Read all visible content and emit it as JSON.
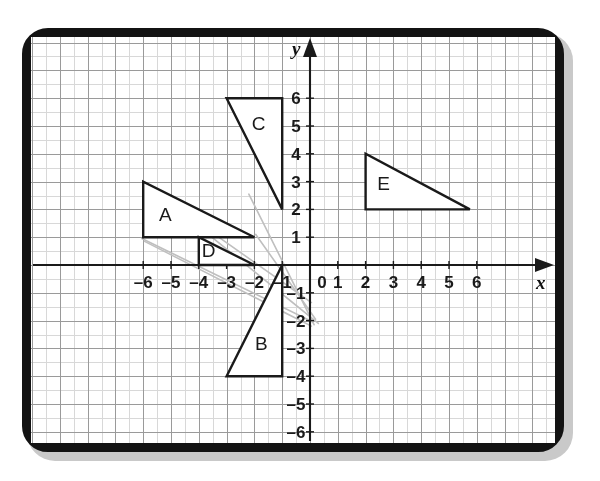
{
  "figure": {
    "kind": "coordinate-plane-with-triangles",
    "background_color": "#ffffff",
    "frame_color": "#131313",
    "grid_minor_color": "#d8d8d8",
    "grid_major_color": "#9a9a9a",
    "axis_color": "#1a1a1a",
    "shape_stroke_color": "#1a1a1a",
    "shape_fill_color": "#ffffff",
    "ghost_line_color": "#bfbfbf"
  },
  "axes": {
    "x_label": "x",
    "y_label": "y",
    "origin_label": "0",
    "x_range": [
      -6.9,
      7.4
    ],
    "y_range": [
      -7.1,
      6.9
    ],
    "unit_px": 27.8,
    "x_tick_labels": [
      "–6",
      "–5",
      "–4",
      "–3",
      "–2",
      "–1",
      "1",
      "2",
      "3",
      "4",
      "5",
      "6"
    ],
    "x_tick_values": [
      -6,
      -5,
      -4,
      -3,
      -2,
      -1,
      1,
      2,
      3,
      4,
      5,
      6
    ],
    "y_tick_labels": [
      "6",
      "5",
      "4",
      "3",
      "2",
      "1",
      "–1",
      "–2",
      "–3",
      "–4",
      "–5",
      "–6"
    ],
    "y_tick_values": [
      6,
      5,
      4,
      3,
      2,
      1,
      -1,
      -2,
      -3,
      -4,
      -5,
      -6
    ],
    "x_arrow": true,
    "y_arrow": true
  },
  "chart_data": {
    "type": "scatter",
    "title": "",
    "xlabel": "x",
    "ylabel": "y",
    "xlim": [
      -6.9,
      7.4
    ],
    "ylim": [
      -7.1,
      6.9
    ],
    "grid": true,
    "legend": "none",
    "shapes": [
      {
        "name": "A",
        "label": "A",
        "type": "right-triangle",
        "vertices": [
          [
            -6,
            3
          ],
          [
            -6,
            1
          ],
          [
            -2,
            1
          ]
        ],
        "label_position": [
          -5.2,
          1.85
        ]
      },
      {
        "name": "B",
        "label": "B",
        "type": "right-triangle",
        "vertices": [
          [
            -1,
            0
          ],
          [
            -1,
            -4
          ],
          [
            -3,
            -4
          ]
        ],
        "label_position": [
          -1.75,
          -2.8
        ]
      },
      {
        "name": "C",
        "label": "C",
        "type": "right-triangle",
        "vertices": [
          [
            -3,
            6
          ],
          [
            -1,
            6
          ],
          [
            -1,
            2
          ]
        ],
        "label_position": [
          -1.85,
          5.1
        ]
      },
      {
        "name": "D",
        "label": "D",
        "type": "right-triangle",
        "vertices": [
          [
            -4,
            1
          ],
          [
            -4,
            0
          ],
          [
            -2,
            0
          ]
        ],
        "label_position": [
          -3.65,
          0.55
        ]
      },
      {
        "name": "E",
        "label": "E",
        "type": "right-triangle",
        "vertices": [
          [
            2,
            4
          ],
          [
            2,
            2
          ],
          [
            5.75,
            2
          ]
        ],
        "label_position": [
          2.65,
          2.95
        ]
      }
    ],
    "ghost_lines": [
      {
        "from": [
          -6.05,
          0.95
        ],
        "to": [
          0.1,
          -2.05
        ]
      },
      {
        "from": [
          -6.0,
          3.0
        ],
        "to": [
          0.3,
          -2.1
        ]
      },
      {
        "from": [
          -5.95,
          0.85
        ],
        "to": [
          0.05,
          -2.2
        ]
      },
      {
        "from": [
          -2.2,
          2.55
        ],
        "to": [
          0.15,
          -2.15
        ]
      },
      {
        "from": [
          -1.95,
          1.1
        ],
        "to": [
          0.2,
          -1.95
        ]
      },
      {
        "from": [
          -3.35,
          1.05
        ],
        "to": [
          0.05,
          -1.35
        ]
      }
    ]
  }
}
